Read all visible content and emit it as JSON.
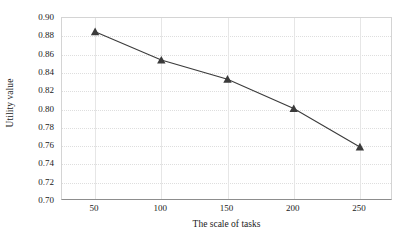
{
  "chart_data": {
    "type": "line",
    "title": "",
    "xlabel": "The scale of tasks",
    "ylabel": "Utility value",
    "x": [
      50,
      100,
      150,
      200,
      250
    ],
    "series": [
      {
        "name": "Utility value",
        "values": [
          0.885,
          0.854,
          0.833,
          0.801,
          0.759
        ],
        "marker": "triangle",
        "color": "#3b3b3b"
      }
    ],
    "xlim": [
      25,
      275
    ],
    "ylim": [
      0.7,
      0.9
    ],
    "xticks": [
      "50",
      "100",
      "150",
      "200",
      "250"
    ],
    "yticks": [
      "0.90",
      "0.88",
      "0.86",
      "0.84",
      "0.82",
      "0.80",
      "0.78",
      "0.76",
      "0.74",
      "0.72",
      "0.70"
    ],
    "ytick_values": [
      0.9,
      0.88,
      0.86,
      0.84,
      0.82,
      0.8,
      0.78,
      0.76,
      0.74,
      0.72,
      0.7
    ],
    "grid": {
      "horizontal": true,
      "vertical": true,
      "style": "dotted",
      "color": "#dedede"
    },
    "legend": null,
    "legend_position": "none"
  },
  "axes": {
    "y_title": "Utility value",
    "x_title": "The scale of tasks"
  },
  "colors": {
    "series": "#3b3b3b",
    "grid": "#dedede",
    "plot_border": "#d4d4d4",
    "axis_line": "#8d8d8d",
    "text": "#1a1a1a",
    "background": "#ffffff"
  }
}
